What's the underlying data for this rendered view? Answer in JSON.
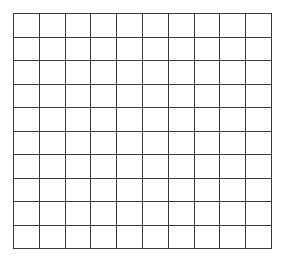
{
  "grid": {
    "rows": 10,
    "columns": 10,
    "line_color": "#3a3a3a",
    "background_color": "#ffffff"
  }
}
